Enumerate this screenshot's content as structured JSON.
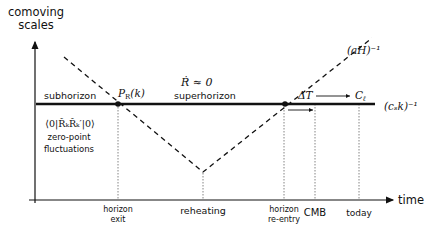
{
  "axes": {
    "y_label_line1": "comoving",
    "y_label_line2": "scales",
    "x_label": "time"
  },
  "regions": {
    "subhorizon": "subhorizon",
    "superhorizon": "superhorizon",
    "zero_point_line1": "⟨0|R̂ₖR̂ₖ′|0⟩",
    "zero_point_line2": "zero-point",
    "zero_point_line3": "fluctuations",
    "conservation": "Ṙ ≈ 0"
  },
  "curves": {
    "hubble_radius": "(aH)⁻¹",
    "sound_horizon": "(cₛk)⁻¹"
  },
  "points": {
    "power_spectrum": "P",
    "power_spectrum_sub": "R",
    "power_spectrum_arg": "(k)",
    "delta_T": "ΔT",
    "C_ell": "C",
    "C_ell_sub": "ℓ"
  },
  "time_ticks": [
    {
      "line1": "horizon",
      "line2": "exit"
    },
    {
      "line1": "reheating",
      "line2": ""
    },
    {
      "line1": "horizon",
      "line2": "re-entry"
    },
    {
      "line1": "CMB",
      "line2": ""
    },
    {
      "line1": "today",
      "line2": ""
    }
  ]
}
